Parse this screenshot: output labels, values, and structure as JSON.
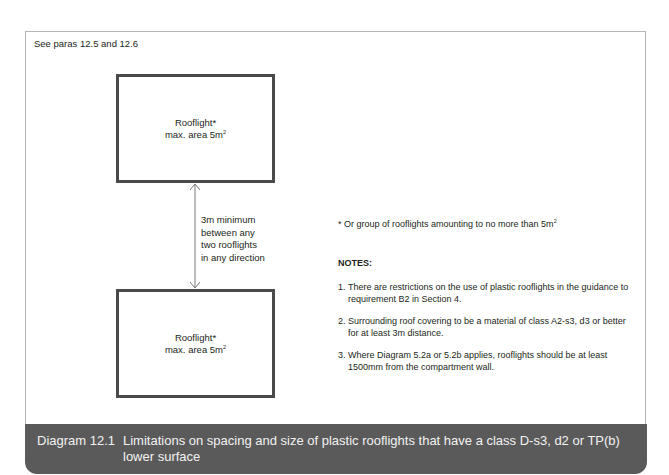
{
  "header": {
    "see_paras": "See paras 12.5 and 12.6"
  },
  "diagram": {
    "rooflight_top": {
      "title": "Rooflight*",
      "area_label": "max. area 5m",
      "area_sup": "2"
    },
    "rooflight_bottom": {
      "title": "Rooflight*",
      "area_label": "max. area 5m",
      "area_sup": "2"
    },
    "spacing_label": [
      "3m minimum",
      "between any",
      "two rooflights",
      "in any direction"
    ]
  },
  "footnote": {
    "text": "*  Or group of rooflights amounting to no more than 5m",
    "sup": "2"
  },
  "notes": {
    "heading": "NOTES:",
    "items": [
      {
        "num": "1.",
        "text": "There are restrictions on the use of plastic rooflights in the guidance to requirement B2 in Section 4."
      },
      {
        "num": "2.",
        "text": "Surrounding roof covering to be a material of class A2-s3, d3 or better for at least 3m distance."
      },
      {
        "num": "3.",
        "text": "Where Diagram 5.2a or 5.2b applies, rooflights should be at least 1500mm from the compartment wall."
      }
    ]
  },
  "caption": {
    "number": "Diagram 12.1",
    "text": "Limitations on spacing and size of plastic rooflights that have a class D-s3, d2 or TP(b) lower surface"
  },
  "colors": {
    "caption_bg": "#5a5a5a",
    "box_border": "#4a4a4a",
    "arrow": "#7a7a7a"
  }
}
